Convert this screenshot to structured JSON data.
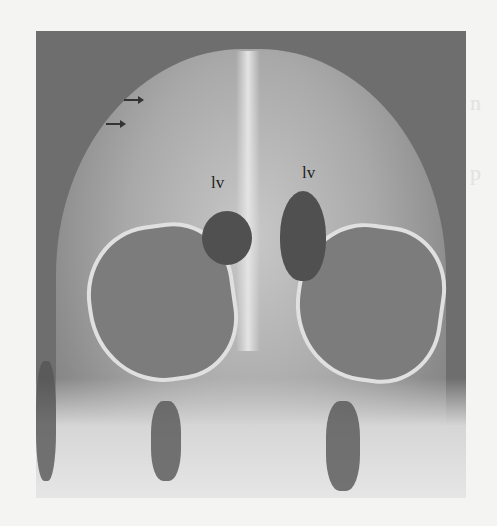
{
  "figure": {
    "type": "radiograph",
    "labels": [
      "lv",
      "lv"
    ],
    "arrows": 2,
    "colors": {
      "background": "#f4f4f2",
      "film_dark": "#6e6e6e",
      "bone_light": "#e0e0e0"
    }
  }
}
